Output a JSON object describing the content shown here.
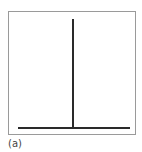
{
  "figure": {
    "caption": "(a)",
    "colors": {
      "frame": "#9a9a9a",
      "lines": "#2a2a2a",
      "background": "#ffffff"
    }
  }
}
